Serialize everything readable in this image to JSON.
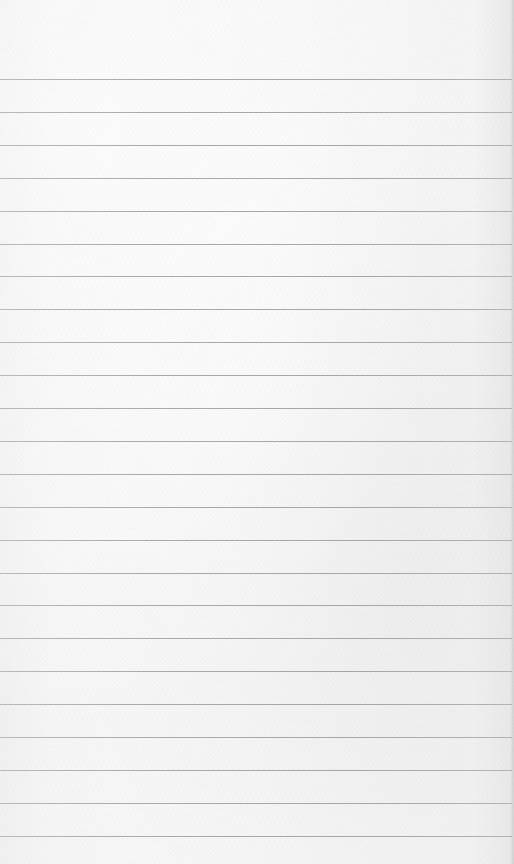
{
  "page": {
    "type": "lined-paper",
    "background_color": "#f6f6f6",
    "rule_color": "#a8a8a8",
    "rule_count": 24,
    "first_rule_y": 79,
    "rule_spacing": 32.9
  }
}
